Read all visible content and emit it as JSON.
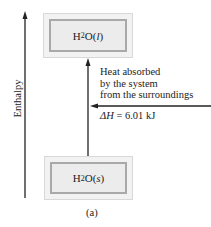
{
  "diagram": {
    "axis": {
      "label": "Enthalpy",
      "direction": "up"
    },
    "states": [
      {
        "id": "liquid",
        "formula": "H",
        "sub": "2",
        "rest": "O",
        "phase": "l",
        "position": "top"
      },
      {
        "id": "solid",
        "formula": "H",
        "sub": "2",
        "rest": "O",
        "phase": "s",
        "position": "bottom"
      }
    ],
    "transition": {
      "from": "solid",
      "to": "liquid",
      "description_lines": [
        "Heat absorbed",
        "by the system",
        "from the surroundings"
      ],
      "delta_h_symbol": "ΔH",
      "delta_h_value": " = 6.01 kJ"
    },
    "caption": "(a)",
    "colors": {
      "box_fill": "#ececec",
      "box_border": "#a9a9a9",
      "line": "#222222"
    }
  }
}
